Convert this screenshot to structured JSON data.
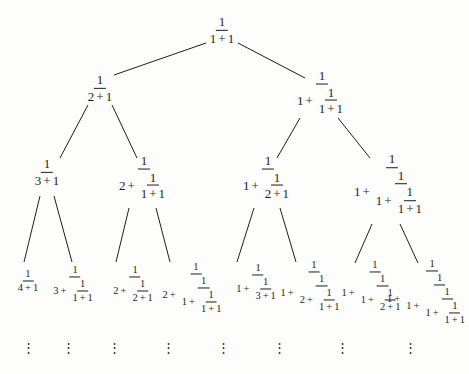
{
  "figure": {
    "background_color": "#fdfdfb",
    "ink_color": "#1d1d1d",
    "levels": 4,
    "leaf_continuation": "vertical-ellipsis"
  },
  "symbols": {
    "one": "1",
    "two": "2",
    "three": "3",
    "four": "4",
    "plus": "+",
    "vertical_ellipsis": "⋮"
  },
  "nodes": {
    "root": {
      "id": "n0",
      "level": 0,
      "x": 222,
      "y": 30,
      "expression": "1/(1+1)",
      "value": "1/2",
      "leading_term": "1"
    },
    "level1": [
      {
        "id": "n1",
        "level": 1,
        "x": 100,
        "y": 88,
        "expression": "1/(2+1)",
        "value": "1/3",
        "leading_term": "2"
      },
      {
        "id": "n2",
        "level": 1,
        "x": 322,
        "y": 92,
        "expression": "1/(1+1/(1+1))",
        "value": "2/3",
        "leading_term": "1"
      }
    ],
    "level2": [
      {
        "id": "n3",
        "level": 2,
        "x": 47,
        "y": 172,
        "expression": "1/(3+1)",
        "value": "1/4",
        "leading_term": "3"
      },
      {
        "id": "n4",
        "level": 2,
        "x": 144,
        "y": 177,
        "expression": "1/(2+1/(1+1))",
        "value": "2/5",
        "leading_term": "2"
      },
      {
        "id": "n5",
        "level": 2,
        "x": 268,
        "y": 177,
        "expression": "1/(1+1/(2+1))",
        "value": "3/4",
        "leading_term": "1"
      },
      {
        "id": "n6",
        "level": 2,
        "x": 392,
        "y": 184,
        "expression": "1/(1+1/(1+1/(1+1)))",
        "value": "3/5",
        "leading_term": "1"
      }
    ],
    "level3": [
      {
        "id": "n7",
        "level": 3,
        "x": 28,
        "y": 281,
        "expression": "1/(4+1)",
        "value": "1/5",
        "leading_term": "4"
      },
      {
        "id": "n8",
        "level": 3,
        "x": 75,
        "y": 284,
        "expression": "1/(3+1/(1+1))",
        "value": "2/7",
        "leading_term": "3"
      },
      {
        "id": "n9",
        "level": 3,
        "x": 135,
        "y": 284,
        "expression": "1/(2+1/(2+1))",
        "value": "3/7",
        "leading_term": "2"
      },
      {
        "id": "n10",
        "level": 3,
        "x": 196,
        "y": 288,
        "expression": "1/(2+1/(1+1/(1+1)))",
        "value": "3/8",
        "leading_term": "2"
      },
      {
        "id": "n11",
        "level": 3,
        "x": 258,
        "y": 282,
        "expression": "1/(1+1/(3+1))",
        "value": "4/5",
        "leading_term": "1"
      },
      {
        "id": "n12",
        "level": 3,
        "x": 314,
        "y": 286,
        "expression": "1/(1+1/(2+1/(1+1)))",
        "value": "5/7",
        "leading_term": "1"
      },
      {
        "id": "n13",
        "level": 3,
        "x": 375,
        "y": 286,
        "expression": "1/(1+1/(1+1/(2+1)))",
        "value": "4/7",
        "leading_term": "1"
      },
      {
        "id": "n14",
        "level": 3,
        "x": 432,
        "y": 292,
        "expression": "1/(1+1/(1+1/(1+1/(1+1))))",
        "value": "5/8",
        "leading_term": "1"
      }
    ]
  },
  "edges": [
    {
      "from": "n0",
      "to": "n1",
      "x1": 206,
      "y1": 43,
      "x2": 114,
      "y2": 75
    },
    {
      "from": "n0",
      "to": "n2",
      "x1": 238,
      "y1": 43,
      "x2": 305,
      "y2": 78
    },
    {
      "from": "n1",
      "to": "n3",
      "x1": 88,
      "y1": 105,
      "x2": 60,
      "y2": 158
    },
    {
      "from": "n1",
      "to": "n4",
      "x1": 112,
      "y1": 105,
      "x2": 137,
      "y2": 158
    },
    {
      "from": "n2",
      "to": "n5",
      "x1": 300,
      "y1": 118,
      "x2": 277,
      "y2": 158
    },
    {
      "from": "n2",
      "to": "n6",
      "x1": 338,
      "y1": 118,
      "x2": 370,
      "y2": 158
    },
    {
      "from": "n3",
      "to": "n7",
      "x1": 40,
      "y1": 196,
      "x2": 24,
      "y2": 262
    },
    {
      "from": "n3",
      "to": "n8",
      "x1": 54,
      "y1": 196,
      "x2": 72,
      "y2": 262
    },
    {
      "from": "n4",
      "to": "n9",
      "x1": 129,
      "y1": 208,
      "x2": 116,
      "y2": 262
    },
    {
      "from": "n4",
      "to": "n10",
      "x1": 156,
      "y1": 208,
      "x2": 170,
      "y2": 262
    },
    {
      "from": "n5",
      "to": "n11",
      "x1": 254,
      "y1": 208,
      "x2": 237,
      "y2": 262
    },
    {
      "from": "n5",
      "to": "n12",
      "x1": 280,
      "y1": 208,
      "x2": 296,
      "y2": 262
    },
    {
      "from": "n6",
      "to": "n13",
      "x1": 372,
      "y1": 224,
      "x2": 355,
      "y2": 263
    },
    {
      "from": "n6",
      "to": "n14",
      "x1": 400,
      "y1": 224,
      "x2": 418,
      "y2": 263
    }
  ],
  "ellipses": [
    {
      "id": "e1",
      "x": 28,
      "y": 348
    },
    {
      "id": "e2",
      "x": 68,
      "y": 348
    },
    {
      "id": "e3",
      "x": 114,
      "y": 348
    },
    {
      "id": "e4",
      "x": 168,
      "y": 348
    },
    {
      "id": "e5",
      "x": 223,
      "y": 348
    },
    {
      "id": "e6",
      "x": 279,
      "y": 348
    },
    {
      "id": "e7",
      "x": 342,
      "y": 348
    },
    {
      "id": "e8",
      "x": 410,
      "y": 348
    }
  ]
}
